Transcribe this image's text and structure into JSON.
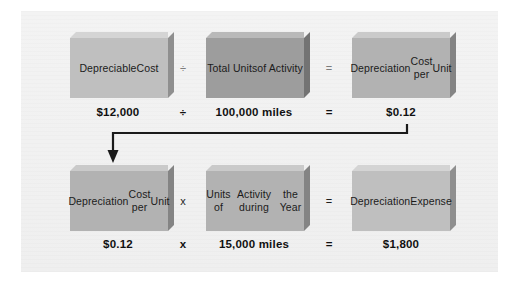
{
  "figure": {
    "background_color": "#f1f1f1",
    "box_tones": {
      "light": "#bfbfbf",
      "mid": "#b2b2b2",
      "dark": "#9d9d9d"
    },
    "connector": {
      "name": "result-carry-arrow",
      "color": "#1a1a1a",
      "from_label": "$0.12",
      "to_label": "Depreciation Cost per Unit"
    }
  },
  "rows": [
    {
      "id": "formula-row",
      "boxes": [
        {
          "lines": [
            "Depreciable",
            "Cost"
          ],
          "tone": "light"
        },
        {
          "lines": [
            "Total Units",
            "of Activity"
          ],
          "tone": "dark"
        },
        {
          "lines": [
            "Depreciation",
            "Cost per",
            "Unit"
          ],
          "tone": "mid"
        }
      ],
      "operators": [
        "÷",
        "="
      ],
      "values": [
        "$12,000",
        "100,000 miles",
        "$0.12"
      ],
      "value_operators": [
        "÷",
        "="
      ]
    },
    {
      "id": "computation-row",
      "boxes": [
        {
          "lines": [
            "Depreciation",
            "Cost per",
            "Unit"
          ],
          "tone": "mid"
        },
        {
          "lines": [
            "Units of",
            "Activity during",
            "the Year"
          ],
          "tone": "mid"
        },
        {
          "lines": [
            "Depreciation",
            "Expense"
          ],
          "tone": "light"
        }
      ],
      "operators": [
        "x",
        "="
      ],
      "values": [
        "$0.12",
        "15,000 miles",
        "$1,800"
      ],
      "value_operators": [
        "x",
        "="
      ]
    }
  ]
}
